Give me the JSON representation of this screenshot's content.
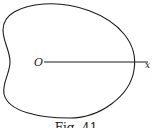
{
  "figure": {
    "origin_label": "O",
    "axis_label": "x",
    "caption": "Fig. 41",
    "stroke_color": "#1a1a1a",
    "background": "#ffffff"
  }
}
